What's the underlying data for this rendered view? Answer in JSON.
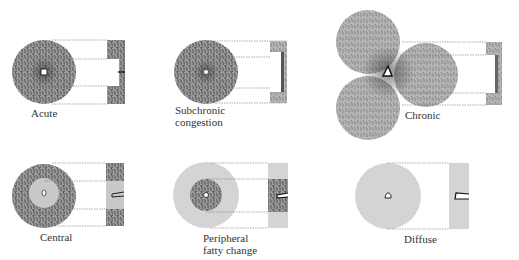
{
  "colors": {
    "tissue": "#8a8a8a",
    "tissue_dark": "#555555",
    "fatty": "#d4d4d4",
    "guide_line": "#777777"
  },
  "panels": [
    {
      "id": "acute",
      "label": "Acute"
    },
    {
      "id": "subchronic",
      "label": "Subchronic congestion",
      "lines": [
        "Subchronic",
        "congestion"
      ]
    },
    {
      "id": "chronic",
      "label": "Chronic"
    },
    {
      "id": "central",
      "label": "Central"
    },
    {
      "id": "peripheral",
      "label": "Peripheral fatty change",
      "lines": [
        "Peripheral",
        "fatty change"
      ]
    },
    {
      "id": "diffuse",
      "label": "Diffuse"
    }
  ]
}
